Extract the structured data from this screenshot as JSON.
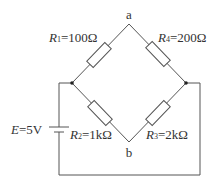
{
  "nodes": {
    "top": "a",
    "bottom": "b"
  },
  "resistors": [
    {
      "name": "R",
      "sub": "1",
      "value": "=100Ω"
    },
    {
      "name": "R",
      "sub": "4",
      "value": "=200Ω"
    },
    {
      "name": "R",
      "sub": "2",
      "value": "=1kΩ"
    },
    {
      "name": "R",
      "sub": "3",
      "value": "=2kΩ"
    }
  ],
  "source": {
    "name": "E",
    "value": "=5V"
  }
}
